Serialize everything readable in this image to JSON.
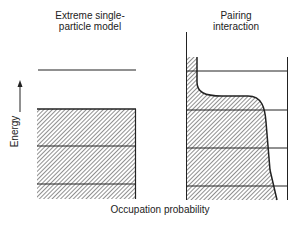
{
  "panels": {
    "left": {
      "title_line1": "Extreme single-",
      "title_line2": "particle model"
    },
    "right": {
      "title_line1": "Pairing",
      "title_line2": "interaction"
    }
  },
  "axes": {
    "y_label": "Energy",
    "x_label": "Occupation probability"
  },
  "colors": {
    "ink": "#222222",
    "background": "#ffffff"
  }
}
